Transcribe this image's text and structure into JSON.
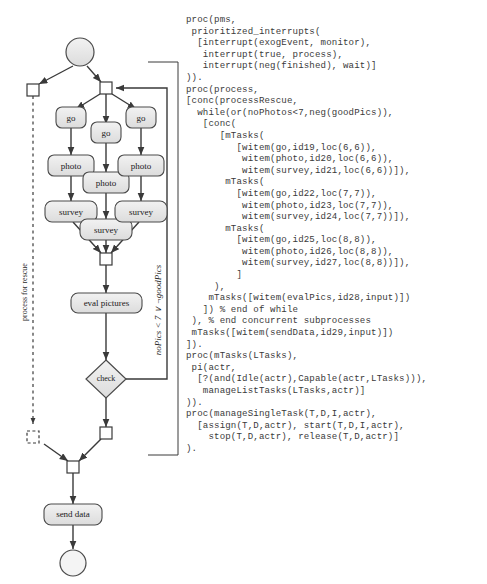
{
  "diagram": {
    "title": "process for rescue",
    "swimlane_label": "process for rescue",
    "loop_condition": "noPics < 7 ∨ ¬goodPics",
    "nodes": [
      {
        "id": "start",
        "type": "start-event",
        "label": ""
      },
      {
        "id": "split-left",
        "type": "gateway-square",
        "label": ""
      },
      {
        "id": "fork-main",
        "type": "gateway-square",
        "label": ""
      },
      {
        "id": "go1",
        "type": "task",
        "label": "go"
      },
      {
        "id": "go2",
        "type": "task",
        "label": "go"
      },
      {
        "id": "go3",
        "type": "task",
        "label": "go"
      },
      {
        "id": "photo1",
        "type": "task",
        "label": "photo"
      },
      {
        "id": "photo2",
        "type": "task",
        "label": "photo"
      },
      {
        "id": "photo3",
        "type": "task",
        "label": "photo"
      },
      {
        "id": "survey1",
        "type": "task",
        "label": "survey"
      },
      {
        "id": "survey2",
        "type": "task",
        "label": "survey"
      },
      {
        "id": "survey3",
        "type": "task",
        "label": "survey"
      },
      {
        "id": "join-main",
        "type": "gateway-square",
        "label": ""
      },
      {
        "id": "eval",
        "type": "task",
        "label": "eval pictures"
      },
      {
        "id": "check",
        "type": "gateway-diamond",
        "label": "check"
      },
      {
        "id": "after-check",
        "type": "gateway-square",
        "label": ""
      },
      {
        "id": "dashed-end",
        "type": "gateway-square-dashed",
        "label": ""
      },
      {
        "id": "final-join",
        "type": "gateway-square",
        "label": ""
      },
      {
        "id": "senddata",
        "type": "task",
        "label": "send data"
      },
      {
        "id": "end",
        "type": "end-event",
        "label": ""
      }
    ]
  },
  "code": {
    "blocks": [
      {
        "name": "proc-pms",
        "lines": [
          "proc(pms,",
          " prioritized_interrupts(",
          "  [interrupt(exogEvent, monitor),",
          "   interrupt(true, process),",
          "   interrupt(neg(finished), wait)]",
          ")).",
          ""
        ]
      },
      {
        "name": "proc-process",
        "lines": [
          "proc(process,",
          "[conc(processRescue,",
          "  while(or(noPhotos<7,neg(goodPics)),",
          "   [conc(",
          "      [mTasks(",
          "         [witem(go,id19,loc(6,6)),",
          "          witem(photo,id20,loc(6,6)),",
          "          witem(survey,id21,loc(6,6))]),",
          "       mTasks(",
          "         [witem(go,id22,loc(7,7)),",
          "          witem(photo,id23,loc(7,7)),",
          "          witem(survey,id24,loc(7,7))]),",
          "       mTasks(",
          "         [witem(go,id25,loc(8,8)),",
          "          witem(photo,id26,loc(8,8)),",
          "          witem(survey,id27,loc(8,8))]),",
          "         ]",
          "     ),",
          "    mTasks([witem(evalPics,id28,input)])",
          "   ]) % end of while",
          " ), % end concurrent subprocesses",
          " mTasks([witem(sendData,id29,input)])",
          "]).",
          ""
        ]
      },
      {
        "name": "proc-mTasks",
        "lines": [
          "proc(mTasks(LTasks),",
          " pi(actr,",
          "  [?(and(Idle(actr),Capable(actr,LTasks))),",
          "   manageListTasks(LTasks,actr)]",
          ")).",
          ""
        ]
      },
      {
        "name": "proc-manageSingleTask",
        "lines": [
          "proc(manageSingleTask(T,D,I,actr),",
          "  [assign(T,D,actr), start(T,D,I,actr),",
          "    stop(T,D,actr), release(T,D,actr)]",
          ").",
          ""
        ]
      }
    ]
  },
  "colors": {
    "node_fill": "#e6e6e6",
    "node_stroke": "#4a4a4a",
    "line": "#3a3a3a",
    "text": "#1a1a1a",
    "background": "#ffffff"
  }
}
